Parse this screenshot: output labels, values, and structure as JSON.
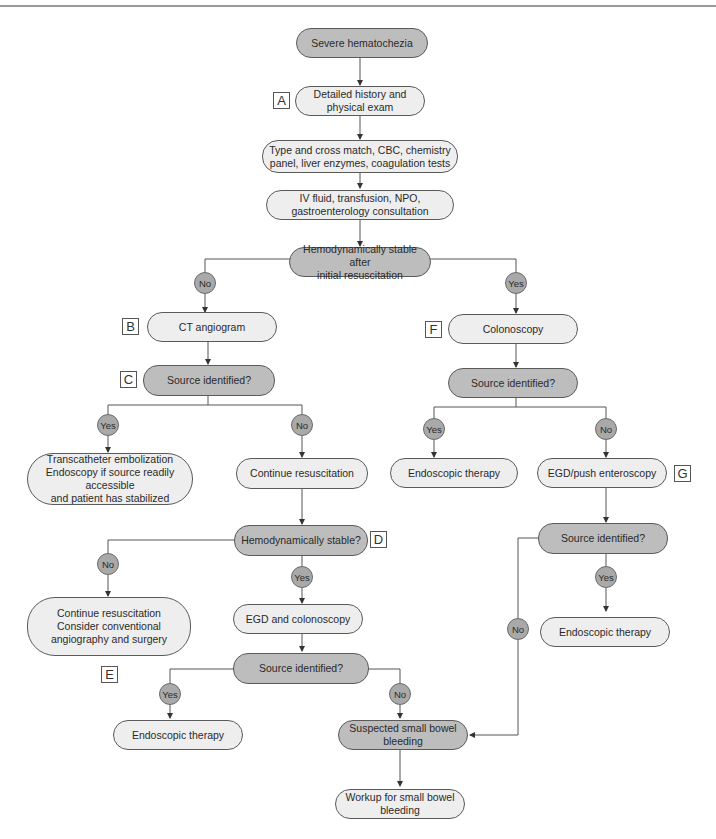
{
  "colors": {
    "action_fill": "#eeeeee",
    "decision_fill": "#bdbdbd",
    "badge_fill": "#a9a9a9",
    "line": "#555555"
  },
  "nodes": {
    "start": "Severe hematochezia",
    "history": "Detailed history and\nphysical exam",
    "labs": "Type and cross match, CBC, chemistry\npanel, liver enzymes, coagulation tests",
    "iv": "IV fluid, transfusion, NPO,\ngastroenterology consultation",
    "stable_initial": "Hemodynamically stable after\ninitial resuscitation",
    "ct": "CT angiogram",
    "ct_source": "Source identified?",
    "embolization": "Transcatheter embolization\nEndoscopy if source readily accessible\nand patient has stabilized",
    "continue_resus": "Continue resuscitation",
    "stable_q": "Hemodynamically stable?",
    "resus_surgery": "Continue resuscitation\nConsider conventional\nangiography and surgery",
    "egd_colon": "EGD and colonoscopy",
    "egd_colon_source": "Source identified?",
    "endo_left": "Endoscopic therapy",
    "small_bowel_suspected": "Suspected small bowel\nbleeding",
    "small_bowel_workup": "Workup for small bowel\nbleeding",
    "colonoscopy": "Colonoscopy",
    "colon_source": "Source identified?",
    "endo_mid": "Endoscopic therapy",
    "push_entero": "EGD/push enteroscopy",
    "push_source": "Source identified?",
    "endo_right": "Endoscopic therapy"
  },
  "badges": {
    "no_initial": "No",
    "yes_initial": "Yes",
    "yes_ct": "Yes",
    "no_ct": "No",
    "no_stable": "No",
    "yes_stable": "Yes",
    "yes_egd": "Yes",
    "no_egd": "No",
    "yes_colon": "Yes",
    "no_colon": "No",
    "yes_push": "Yes",
    "no_push": "No"
  },
  "letters": {
    "A": "A",
    "B": "B",
    "C": "C",
    "D": "D",
    "E": "E",
    "F": "F",
    "G": "G"
  }
}
